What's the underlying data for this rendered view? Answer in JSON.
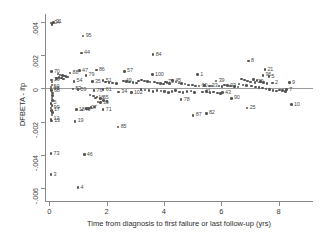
{
  "chart_data": {
    "type": "scatter",
    "title": "",
    "subtitle": "",
    "xlabel": "Time from diagnosis to first failure or last follow-up (yrs)",
    "ylabel": "DFBETA - lfp",
    "xlim": [
      -0.15,
      9.2
    ],
    "ylim": [
      -0.0068,
      0.0045
    ],
    "grid": false,
    "legend": null,
    "xticks": [
      0,
      2,
      4,
      6,
      8
    ],
    "xtick_labels": [
      "0",
      "2",
      "4",
      "6",
      "8"
    ],
    "yticks": [
      0.004,
      0.002,
      0,
      -0.002,
      -0.004,
      -0.006
    ],
    "ytick_labels": [
      ".004",
      ".002",
      "0",
      "-.002",
      "-.004",
      "-.006"
    ],
    "reference_line_y": 0,
    "marker_color": "#555555",
    "label_color": "#4a4a4a",
    "axis_color": "#8a8a8a",
    "point_label_position": "right",
    "points": [
      {
        "label": "34",
        "x": 0.08,
        "y": 0.00395
      },
      {
        "label": "31",
        "x": 0.14,
        "y": 0.004
      },
      {
        "label": "95",
        "x": 1.18,
        "y": 0.00316
      },
      {
        "label": "44",
        "x": 1.12,
        "y": 0.00214
      },
      {
        "label": "84",
        "x": 3.62,
        "y": 0.00205
      },
      {
        "label": "8",
        "x": 6.95,
        "y": 0.00166
      },
      {
        "label": "70",
        "x": 0.07,
        "y": 0.00102
      },
      {
        "label": "47",
        "x": 1.05,
        "y": 0.00108
      },
      {
        "label": "86",
        "x": 1.64,
        "y": 0.00112
      },
      {
        "label": "57",
        "x": 2.62,
        "y": 0.00104
      },
      {
        "label": "100",
        "x": 3.6,
        "y": 0.00085
      },
      {
        "label": "21",
        "x": 7.52,
        "y": 0.00113
      },
      {
        "label": "88",
        "x": 0.72,
        "y": 0.00094
      },
      {
        "label": "79",
        "x": 1.28,
        "y": 0.0008
      },
      {
        "label": "1",
        "x": 5.18,
        "y": 0.00084
      },
      {
        "label": "96",
        "x": 7.45,
        "y": 0.00079
      },
      {
        "label": "5",
        "x": 7.66,
        "y": 0.00072
      },
      {
        "label": "29",
        "x": 0.07,
        "y": 0.00052
      },
      {
        "label": "54",
        "x": 0.86,
        "y": 0.00043
      },
      {
        "label": "35",
        "x": 1.5,
        "y": 0.00042
      },
      {
        "label": "51",
        "x": 1.88,
        "y": 0.00048
      },
      {
        "label": "49",
        "x": 2.58,
        "y": 0.00046
      },
      {
        "label": "45",
        "x": 4.3,
        "y": 0.00048
      },
      {
        "label": "39",
        "x": 5.82,
        "y": 0.00044
      },
      {
        "label": "20",
        "x": 7.18,
        "y": 0.00037
      },
      {
        "label": "2",
        "x": 7.78,
        "y": 0.00032
      },
      {
        "label": "9",
        "x": 8.38,
        "y": 0.00035
      },
      {
        "label": "75",
        "x": 4.05,
        "y": 0.0004
      },
      {
        "label": "60",
        "x": 5.22,
        "y": 0.00016
      },
      {
        "label": "33",
        "x": 5.58,
        "y": 0.00015
      },
      {
        "label": "93",
        "x": 6.22,
        "y": 0.00018
      },
      {
        "label": "50",
        "x": 0.06,
        "y": 8e-05
      },
      {
        "label": "98",
        "x": 0.06,
        "y": -2e-05
      },
      {
        "label": "68",
        "x": 0.07,
        "y": -0.00012
      },
      {
        "label": "53",
        "x": 0.82,
        "y": -2e-05
      },
      {
        "label": "59",
        "x": 1.0,
        "y": -8e-05
      },
      {
        "label": "76",
        "x": 1.56,
        "y": -0.00012
      },
      {
        "label": "61",
        "x": 1.88,
        "y": -8e-05
      },
      {
        "label": "34b",
        "x": 2.42,
        "y": -0.00022
      },
      {
        "label": "102",
        "x": 2.86,
        "y": -0.00024
      },
      {
        "label": "41",
        "x": 5.34,
        "y": -0.00022
      },
      {
        "label": "43",
        "x": 6.04,
        "y": -0.00026
      },
      {
        "label": "7",
        "x": 8.28,
        "y": -8e-05
      },
      {
        "label": "65",
        "x": 1.78,
        "y": -0.0006
      },
      {
        "label": "16",
        "x": 1.62,
        "y": -0.00058
      },
      {
        "label": "39b",
        "x": 1.78,
        "y": -0.00086
      },
      {
        "label": "78",
        "x": 4.6,
        "y": -0.00068
      },
      {
        "label": "90",
        "x": 6.35,
        "y": -0.0006
      },
      {
        "label": "10",
        "x": 8.45,
        "y": -0.00098
      },
      {
        "label": "25",
        "x": 6.9,
        "y": -0.00118
      },
      {
        "label": "5b",
        "x": 0.06,
        "y": -0.0009
      },
      {
        "label": "99",
        "x": 0.06,
        "y": -0.00118
      },
      {
        "label": "17",
        "x": 0.07,
        "y": -0.00132
      },
      {
        "label": "18",
        "x": 0.94,
        "y": -0.00128
      },
      {
        "label": "48",
        "x": 1.14,
        "y": -0.0013
      },
      {
        "label": "27",
        "x": 1.36,
        "y": -0.0012
      },
      {
        "label": "71",
        "x": 1.88,
        "y": -0.00128
      },
      {
        "label": "12",
        "x": 0.06,
        "y": -0.00186
      },
      {
        "label": "13",
        "x": 0.08,
        "y": -0.00196
      },
      {
        "label": "19",
        "x": 0.9,
        "y": -0.00198
      },
      {
        "label": "85",
        "x": 2.4,
        "y": -0.00232
      },
      {
        "label": "87",
        "x": 5.02,
        "y": -0.00162
      },
      {
        "label": "82",
        "x": 5.48,
        "y": -0.0015
      },
      {
        "label": "73",
        "x": 0.06,
        "y": -0.00394
      },
      {
        "label": "46",
        "x": 1.22,
        "y": -0.004
      },
      {
        "label": "3",
        "x": 0.06,
        "y": -0.0052
      },
      {
        "label": "4",
        "x": 1.0,
        "y": -0.00598
      }
    ],
    "cluster_points": [
      {
        "x": 0.3,
        "y": 0.00088
      },
      {
        "x": 0.38,
        "y": 0.00082
      },
      {
        "x": 0.46,
        "y": 0.0008
      },
      {
        "x": 0.52,
        "y": 0.00076
      },
      {
        "x": 0.58,
        "y": 0.00072
      },
      {
        "x": 0.64,
        "y": 0.0007
      },
      {
        "x": 0.34,
        "y": 0.00068
      },
      {
        "x": 0.42,
        "y": 0.00064
      },
      {
        "x": 0.26,
        "y": 0.0006
      },
      {
        "x": 0.5,
        "y": 0.00058
      },
      {
        "x": 1.96,
        "y": 0.0004
      },
      {
        "x": 2.08,
        "y": 0.00036
      },
      {
        "x": 2.2,
        "y": 0.00034
      },
      {
        "x": 2.34,
        "y": 0.0003
      },
      {
        "x": 2.7,
        "y": 0.00042
      },
      {
        "x": 2.8,
        "y": 0.00038
      },
      {
        "x": 2.92,
        "y": 0.00036
      },
      {
        "x": 3.04,
        "y": 0.00032
      },
      {
        "x": 3.12,
        "y": 0.00044
      },
      {
        "x": 3.22,
        "y": 0.0005
      },
      {
        "x": 3.32,
        "y": 0.00046
      },
      {
        "x": 3.42,
        "y": 0.00042
      },
      {
        "x": 3.52,
        "y": 0.00038
      },
      {
        "x": 3.68,
        "y": 0.0004
      },
      {
        "x": 3.78,
        "y": 0.00034
      },
      {
        "x": 3.88,
        "y": 0.0003
      },
      {
        "x": 3.98,
        "y": 0.00026
      },
      {
        "x": 4.1,
        "y": 0.00036
      },
      {
        "x": 4.2,
        "y": 0.0003
      },
      {
        "x": 4.42,
        "y": 0.00038
      },
      {
        "x": 4.52,
        "y": 0.00034
      },
      {
        "x": 4.62,
        "y": 0.0003
      },
      {
        "x": 4.74,
        "y": 0.00026
      },
      {
        "x": 4.86,
        "y": 0.00022
      },
      {
        "x": 5.0,
        "y": 0.0002
      },
      {
        "x": 5.1,
        "y": 0.00016
      },
      {
        "x": 5.42,
        "y": 0.00018
      },
      {
        "x": 5.68,
        "y": 0.00014
      },
      {
        "x": 5.92,
        "y": 0.00016
      },
      {
        "x": 6.02,
        "y": 0.00012
      },
      {
        "x": 6.12,
        "y": 0.0002
      },
      {
        "x": 6.32,
        "y": 0.00016
      },
      {
        "x": 6.46,
        "y": 0.00012
      },
      {
        "x": 6.58,
        "y": 0.0001
      },
      {
        "x": 6.7,
        "y": 0.00056
      },
      {
        "x": 6.8,
        "y": 0.0005
      },
      {
        "x": 6.92,
        "y": 0.00046
      },
      {
        "x": 7.02,
        "y": 0.0004
      },
      {
        "x": 7.12,
        "y": 0.00054
      },
      {
        "x": 7.24,
        "y": 0.00048
      },
      {
        "x": 7.36,
        "y": 0.00042
      },
      {
        "x": 7.48,
        "y": 0.00036
      },
      {
        "x": 7.6,
        "y": 0.0003
      },
      {
        "x": 6.62,
        "y": 0.00026
      },
      {
        "x": 6.76,
        "y": 0.00022
      },
      {
        "x": 6.88,
        "y": 0.00018
      },
      {
        "x": 7.06,
        "y": 0.00014
      },
      {
        "x": 7.2,
        "y": 0.0001
      },
      {
        "x": 7.32,
        "y": 6e-05
      },
      {
        "x": 7.44,
        "y": 2e-05
      },
      {
        "x": 7.56,
        "y": -4e-05
      },
      {
        "x": 7.68,
        "y": -8e-05
      },
      {
        "x": 7.8,
        "y": -0.00012
      },
      {
        "x": 7.92,
        "y": -0.00016
      },
      {
        "x": 8.04,
        "y": -0.0001
      },
      {
        "x": 8.14,
        "y": -0.00014
      },
      {
        "x": 8.24,
        "y": -0.00018
      },
      {
        "x": 3.2,
        "y": -6e-05
      },
      {
        "x": 3.34,
        "y": -0.0001
      },
      {
        "x": 3.48,
        "y": -0.00014
      },
      {
        "x": 3.62,
        "y": -0.00018
      },
      {
        "x": 3.76,
        "y": -0.00012
      },
      {
        "x": 3.9,
        "y": -0.00016
      },
      {
        "x": 4.02,
        "y": -0.0002
      },
      {
        "x": 4.16,
        "y": -0.00024
      },
      {
        "x": 4.28,
        "y": -0.00018
      },
      {
        "x": 4.4,
        "y": -0.00014
      },
      {
        "x": 4.54,
        "y": -0.00022
      },
      {
        "x": 4.66,
        "y": -0.00026
      },
      {
        "x": 4.8,
        "y": -0.0002
      },
      {
        "x": 4.94,
        "y": -0.00016
      },
      {
        "x": 5.06,
        "y": -0.00024
      },
      {
        "x": 5.48,
        "y": -0.0002
      },
      {
        "x": 5.6,
        "y": -0.00026
      },
      {
        "x": 5.72,
        "y": -0.00022
      },
      {
        "x": 5.86,
        "y": -0.00028
      },
      {
        "x": 5.98,
        "y": -0.00032
      },
      {
        "x": 1.42,
        "y": -0.0004
      },
      {
        "x": 1.54,
        "y": -0.00046
      },
      {
        "x": 1.66,
        "y": -0.00052
      },
      {
        "x": 1.9,
        "y": -0.00072
      },
      {
        "x": 2.02,
        "y": -0.00078
      },
      {
        "x": 1.7,
        "y": -0.00082
      },
      {
        "x": 1.3,
        "y": -0.0012
      },
      {
        "x": 1.46,
        "y": -0.00116
      },
      {
        "x": 1.58,
        "y": -0.00112
      },
      {
        "x": 0.1,
        "y": 0.00038
      },
      {
        "x": 0.1,
        "y": 0.00022
      },
      {
        "x": 0.12,
        "y": -0.00028
      },
      {
        "x": 0.12,
        "y": -0.00042
      },
      {
        "x": 0.1,
        "y": -0.00058
      },
      {
        "x": 0.11,
        "y": -0.00074
      },
      {
        "x": 0.1,
        "y": -0.00104
      },
      {
        "x": 0.11,
        "y": -0.00146
      },
      {
        "x": 0.1,
        "y": -0.0016
      },
      {
        "x": 0.09,
        "y": 0.00386
      }
    ]
  }
}
